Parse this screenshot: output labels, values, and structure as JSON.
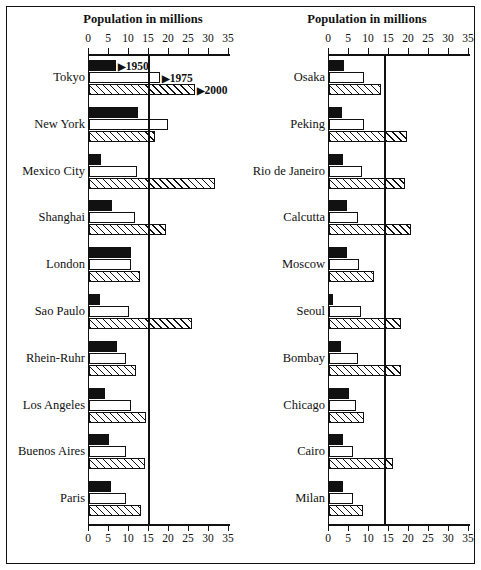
{
  "figure": {
    "axis_title": "Population in millions",
    "tick_labels": [
      "0",
      "5",
      "10",
      "15",
      "20",
      "25",
      "30",
      "35"
    ],
    "legend": [
      {
        "label": "1950",
        "marker": "▶"
      },
      {
        "label": "1975",
        "marker": "▶"
      },
      {
        "label": "2000",
        "marker": "▶"
      }
    ]
  },
  "chart_data": {
    "type": "bar",
    "title": "Population in millions",
    "xlabel": "Population in millions",
    "ylabel": "",
    "xlim": [
      0,
      35
    ],
    "xticks": [
      0,
      5,
      10,
      15,
      20,
      25,
      30,
      35
    ],
    "grid": false,
    "orientation": "horizontal",
    "legend_position": "inline-first-group",
    "series": [
      {
        "name": "1950",
        "style": "solid-black"
      },
      {
        "name": "1975",
        "style": "white-outline"
      },
      {
        "name": "2000",
        "style": "diagonal-hatch"
      }
    ],
    "panels": [
      {
        "name": "left",
        "categories": [
          "Tokyo",
          "New York",
          "Mexico City",
          "Shanghai",
          "London",
          "Sao Paulo",
          "Rhein-Ruhr",
          "Los Angeles",
          "Buenos Aires",
          "Paris"
        ],
        "values": {
          "1950": [
            6.7,
            12.3,
            3.1,
            5.8,
            10.4,
            2.8,
            6.9,
            4.0,
            5.0,
            5.4
          ],
          "1975": [
            17.7,
            19.8,
            11.9,
            11.6,
            10.4,
            10.0,
            9.3,
            10.4,
            9.3,
            9.2
          ],
          "2000": [
            26.4,
            16.6,
            31.5,
            19.2,
            12.8,
            25.8,
            11.7,
            14.3,
            13.9,
            12.9
          ]
        }
      },
      {
        "name": "right",
        "categories": [
          "Osaka",
          "Peking",
          "Rio de Janeiro",
          "Calcutta",
          "Moscow",
          "Seoul",
          "Bombay",
          "Chicago",
          "Cairo",
          "Milan"
        ],
        "values": {
          "1950": [
            3.8,
            3.3,
            3.5,
            4.5,
            4.4,
            1.1,
            2.9,
            4.9,
            3.5,
            3.6
          ],
          "1975": [
            8.7,
            8.7,
            8.3,
            7.3,
            7.4,
            8.0,
            7.3,
            6.8,
            6.1,
            6.1
          ],
          "2000": [
            13.0,
            19.4,
            19.0,
            20.4,
            11.2,
            17.9,
            18.1,
            8.8,
            15.9,
            8.6
          ]
        }
      }
    ]
  }
}
